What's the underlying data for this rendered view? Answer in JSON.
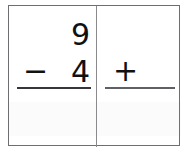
{
  "page": {
    "background_color": "#ffffff",
    "sheet_border_color": "#6e6e72",
    "divider_color": "#8a8a8e",
    "ink_color": "#111111"
  },
  "worksheet": {
    "kind": "math-worksheet-flashcard",
    "problems": [
      {
        "id": "problem-left",
        "operation": "subtraction",
        "operator_symbol": "−",
        "operator_name": "minus-sign",
        "top_operand": "9",
        "bottom_operand": "4",
        "answer": "",
        "answer_placeholder": "",
        "rule_color": "#35353a"
      },
      {
        "id": "problem-right",
        "operation": "addition",
        "operator_symbol": "+",
        "operator_name": "plus-sign",
        "top_operand": "",
        "bottom_operand": "",
        "answer": "",
        "answer_placeholder": "",
        "rule_color": "#5f6065"
      }
    ]
  }
}
